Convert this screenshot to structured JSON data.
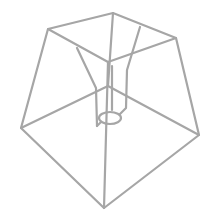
{
  "image": {
    "subject": "lampshade-wire-frame",
    "colors": {
      "background": "#ffffff",
      "wire": "#a6a6a6"
    }
  }
}
